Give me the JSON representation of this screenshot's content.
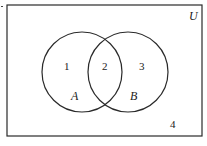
{
  "diagram": {
    "type": "venn",
    "universe": {
      "label": "U",
      "x": 7,
      "y": 5,
      "width": 195,
      "height": 131
    },
    "sets": [
      {
        "label": "A",
        "cx": 82,
        "cy": 72,
        "r": 40,
        "label_x": 75,
        "label_y": 99
      },
      {
        "label": "B",
        "cx": 128,
        "cy": 72,
        "r": 40,
        "label_x": 134,
        "label_y": 99
      }
    ],
    "regions": [
      {
        "id": "1",
        "label": "1",
        "x": 67,
        "y": 70
      },
      {
        "id": "2",
        "label": "2",
        "x": 105,
        "y": 70
      },
      {
        "id": "3",
        "label": "3",
        "x": 142,
        "y": 70
      },
      {
        "id": "4",
        "label": "4",
        "x": 173,
        "y": 127
      }
    ],
    "stroke_color": "#2a2a2a"
  }
}
